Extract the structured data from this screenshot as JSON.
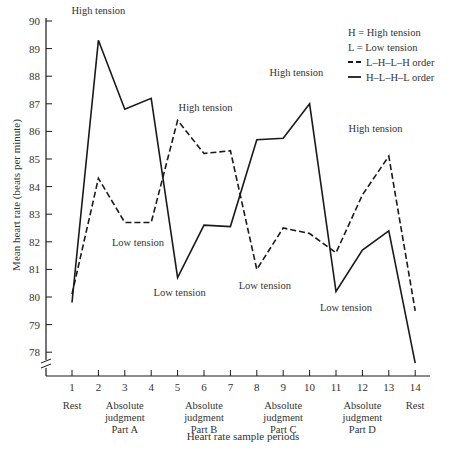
{
  "chart_data": {
    "type": "line",
    "title": "",
    "xlabel": "Heart rate sample periods",
    "ylabel": "Mean heart rate (beats per minute)",
    "ylim": [
      77.5,
      90
    ],
    "y_ticks": [
      78,
      79,
      80,
      81,
      82,
      83,
      84,
      85,
      86,
      87,
      88,
      89,
      90
    ],
    "y_axis_break": true,
    "grid": false,
    "x": [
      1,
      2,
      3,
      4,
      5,
      6,
      7,
      8,
      9,
      10,
      11,
      12,
      13,
      14
    ],
    "period_labels": [
      {
        "text": [
          "Rest"
        ],
        "x": 1
      },
      {
        "text": [
          "Absolute",
          "judgment",
          "Part A"
        ],
        "x": 3
      },
      {
        "text": [
          "Absolute",
          "judgment",
          "Part B"
        ],
        "x": 6
      },
      {
        "text": [
          "Absolute",
          "judgment",
          "Part C"
        ],
        "x": 9
      },
      {
        "text": [
          "Absolute",
          "judgment",
          "Part D"
        ],
        "x": 12
      },
      {
        "text": [
          "Rest"
        ],
        "x": 14
      }
    ],
    "series": [
      {
        "name": "L–H–L–H order",
        "style": "dashed",
        "values": [
          80.1,
          84.3,
          82.7,
          82.7,
          86.4,
          85.2,
          85.3,
          81.0,
          82.5,
          82.3,
          81.6,
          83.7,
          85.1,
          79.5
        ]
      },
      {
        "name": "H–L–H–L order",
        "style": "solid",
        "values": [
          79.8,
          89.3,
          86.8,
          87.2,
          80.7,
          82.6,
          82.55,
          85.7,
          85.75,
          87.0,
          80.2,
          81.7,
          82.4,
          77.6
        ]
      }
    ],
    "annotations": [
      {
        "text": "High tension",
        "x": 2,
        "y": 89.3
      },
      {
        "text": "Low tension",
        "x": 3.5,
        "y": 82.7
      },
      {
        "text": "High tension",
        "x": 5,
        "y": 86.4
      },
      {
        "text": "Low tension",
        "x": 5,
        "y": 80.7
      },
      {
        "text": "High tension",
        "x": 9.5,
        "y": 87.0
      },
      {
        "text": "Low tension",
        "x": 8,
        "y": 81.0
      },
      {
        "text": "High tension",
        "x": 12.5,
        "y": 85.1
      },
      {
        "text": "Low tension",
        "x": 11,
        "y": 80.2
      }
    ],
    "legend": {
      "position": "upper right",
      "notes": [
        "H = High tension",
        "L = Low tension"
      ],
      "entries": [
        {
          "label": "L–H–L–H order",
          "style": "dashed"
        },
        {
          "label": "H–L–H–L order",
          "style": "solid"
        }
      ]
    },
    "colors": {
      "line": "#1a1a1a",
      "text": "#333333"
    }
  }
}
